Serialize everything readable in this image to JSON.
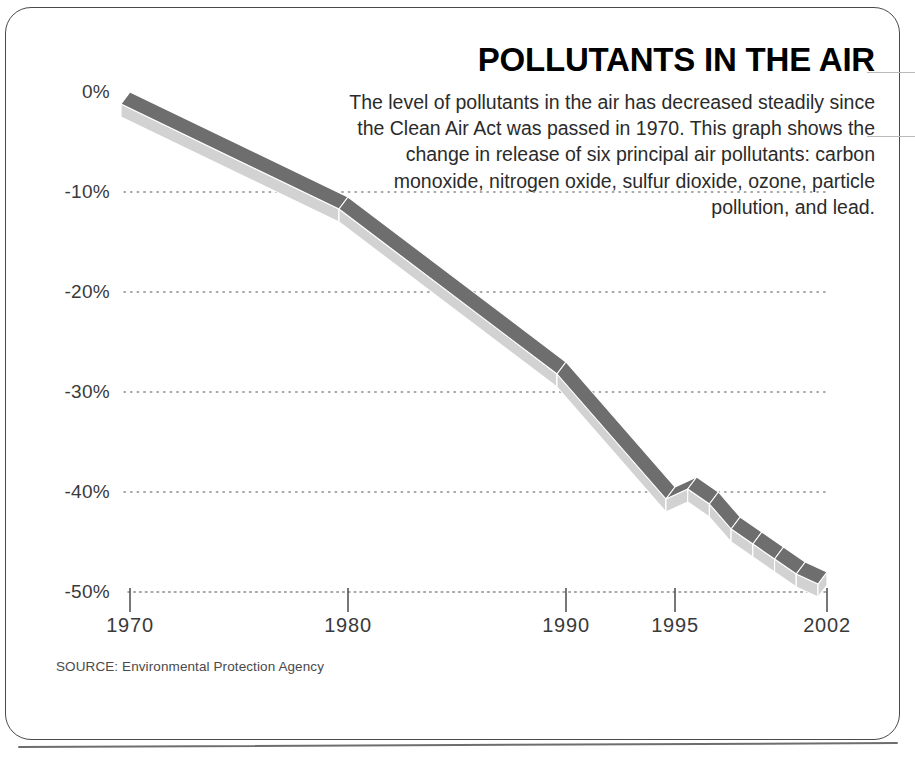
{
  "headline": "POLLUTANTS IN THE AIR",
  "blurb": "The level of pollutants in the air has decreased steadily since the Clean Air Act was passed in 1970. This graph shows the change in release of six principal air pollutants: carbon monoxide, nitrogen oxide, sulfur dioxide, ozone, particle pollution, and lead.",
  "source_note": "SOURCE: Environmental Protection Agency",
  "colors": {
    "ribbon_top": "#6e6e6e",
    "ribbon_side": "#d2d2d2",
    "ribbon_edge": "#ffffff",
    "gridline": "#8c8c8c",
    "axis": "#4a4a4a",
    "frame": "#4a4a4a",
    "text": "#2b2b2b"
  },
  "chart_data": {
    "type": "area",
    "title": "POLLUTANTS IN THE AIR",
    "subtitle": "The level of pollutants in the air has decreased steadily since the Clean Air Act was passed in 1970. This graph shows the change in release of six principal air pollutants: carbon monoxide, nitrogen oxide, sulfur dioxide, ozone, particle pollution, and lead.",
    "xlabel": "",
    "ylabel": "",
    "ylim": [
      -50,
      0
    ],
    "xlim": [
      1970,
      2002
    ],
    "grid": "horizontal-dotted",
    "legend": "none",
    "y_ticks": [
      "0%",
      "-10%",
      "-20%",
      "-30%",
      "-40%",
      "-50%"
    ],
    "y_tick_values": [
      0,
      -10,
      -20,
      -30,
      -40,
      -50
    ],
    "x_ticks": [
      "1970",
      "1980",
      "1990",
      "1995",
      "2002"
    ],
    "x_tick_values": [
      1970,
      1980,
      1990,
      1995,
      2002
    ],
    "series": [
      {
        "name": "Change in release of six principal air pollutants",
        "x": [
          1970,
          1980,
          1990,
          1995,
          1996,
          1997,
          1998,
          1999,
          2000,
          2001,
          2002
        ],
        "values": [
          0,
          -10.5,
          -27,
          -39.5,
          -38.5,
          -40,
          -42.5,
          -44,
          -45.5,
          -47,
          -48
        ]
      }
    ],
    "annotations": [
      "SOURCE: Environmental Protection Agency"
    ]
  }
}
